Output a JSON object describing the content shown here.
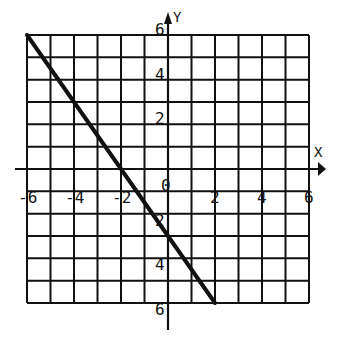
{
  "chart_data": {
    "type": "line",
    "title": "",
    "xlabel": "X",
    "ylabel": "Y",
    "xlim": [
      -6,
      6
    ],
    "ylim": [
      -6,
      6
    ],
    "grid": true,
    "grid_step": 1,
    "x_tick_labels": [
      "-6",
      "-4",
      "-2",
      "0",
      "2",
      "4",
      "6"
    ],
    "x_tick_values": [
      -6,
      -4,
      -2,
      0,
      2,
      4,
      6
    ],
    "y_tick_labels": [
      "6",
      "4",
      "2",
      "2",
      "4",
      "6"
    ],
    "y_tick_values": [
      6,
      4,
      2,
      -2,
      -4,
      -6
    ],
    "series": [
      {
        "name": "line",
        "equation": "y = -1.5x - 3",
        "x": [
          -6,
          2
        ],
        "y": [
          6,
          -6
        ]
      }
    ],
    "colors": {
      "ink": "#111111",
      "background": "#ffffff"
    }
  }
}
